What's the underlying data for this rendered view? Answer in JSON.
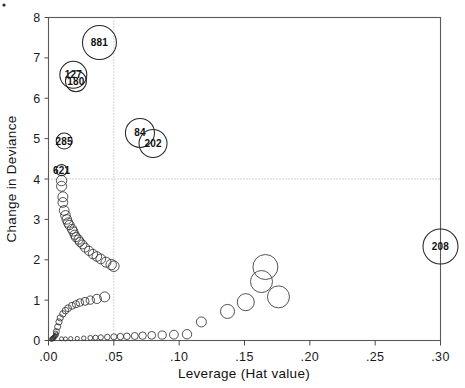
{
  "chart_data": {
    "type": "scatter",
    "title": "",
    "xlabel": "Leverage (Hat value)",
    "ylabel": "Change in Deviance",
    "xlim": [
      0.0,
      0.3
    ],
    "ylim": [
      0,
      8
    ],
    "xticks": [
      0.0,
      0.05,
      0.1,
      0.15,
      0.2,
      0.25,
      0.3
    ],
    "xticklabels": [
      ".00",
      ".05",
      ".10",
      ".15",
      ".20",
      ".25",
      ".30"
    ],
    "yticks": [
      0,
      1,
      2,
      3,
      4,
      5,
      6,
      7,
      8
    ],
    "yticklabels": [
      "0",
      "1",
      "2",
      "3",
      "4",
      "5",
      "6",
      "7",
      "8"
    ],
    "grid": false,
    "legend": "none",
    "reference_lines": [
      {
        "orientation": "horizontal",
        "value": 4.0,
        "style": "dotted"
      },
      {
        "orientation": "vertical",
        "value": 0.05,
        "style": "dotted"
      }
    ],
    "size_encoding": "Cook's distance (bubble area)",
    "labeled_points": [
      {
        "label": "881",
        "x": 0.039,
        "y": 7.38,
        "size": 17.0
      },
      {
        "label": "127",
        "x": 0.019,
        "y": 6.58,
        "size": 13.5
      },
      {
        "label": "180",
        "x": 0.021,
        "y": 6.42,
        "size": 10.5
      },
      {
        "label": "285",
        "x": 0.012,
        "y": 4.94,
        "size": 8.0
      },
      {
        "label": "621",
        "x": 0.01,
        "y": 4.22,
        "size": 5.5
      },
      {
        "label": "84",
        "x": 0.07,
        "y": 5.14,
        "size": 14.5
      },
      {
        "label": "202",
        "x": 0.08,
        "y": 4.88,
        "size": 14.0
      },
      {
        "label": "208",
        "x": 0.3,
        "y": 2.33,
        "size": 17.5
      }
    ],
    "unlabeled_points": [
      {
        "x": 0.01,
        "y": 3.96,
        "size": 5.2
      },
      {
        "x": 0.01,
        "y": 3.82,
        "size": 5.0
      },
      {
        "x": 0.011,
        "y": 3.56,
        "size": 5.0
      },
      {
        "x": 0.011,
        "y": 3.42,
        "size": 4.9
      },
      {
        "x": 0.012,
        "y": 3.22,
        "size": 4.9
      },
      {
        "x": 0.013,
        "y": 3.1,
        "size": 4.8
      },
      {
        "x": 0.014,
        "y": 3.0,
        "size": 4.8
      },
      {
        "x": 0.015,
        "y": 2.92,
        "size": 4.7
      },
      {
        "x": 0.016,
        "y": 2.86,
        "size": 4.7
      },
      {
        "x": 0.018,
        "y": 2.76,
        "size": 4.7
      },
      {
        "x": 0.019,
        "y": 2.7,
        "size": 4.6
      },
      {
        "x": 0.02,
        "y": 2.62,
        "size": 4.6
      },
      {
        "x": 0.021,
        "y": 2.56,
        "size": 4.6
      },
      {
        "x": 0.023,
        "y": 2.5,
        "size": 4.6
      },
      {
        "x": 0.024,
        "y": 2.44,
        "size": 4.5
      },
      {
        "x": 0.026,
        "y": 2.38,
        "size": 4.5
      },
      {
        "x": 0.028,
        "y": 2.3,
        "size": 4.5
      },
      {
        "x": 0.031,
        "y": 2.22,
        "size": 4.6
      },
      {
        "x": 0.034,
        "y": 2.14,
        "size": 4.7
      },
      {
        "x": 0.037,
        "y": 2.08,
        "size": 4.8
      },
      {
        "x": 0.04,
        "y": 2.02,
        "size": 4.9
      },
      {
        "x": 0.044,
        "y": 1.94,
        "size": 5.0
      },
      {
        "x": 0.048,
        "y": 1.88,
        "size": 5.2
      },
      {
        "x": 0.05,
        "y": 1.84,
        "size": 5.3
      },
      {
        "x": 0.006,
        "y": 0.22,
        "size": 3.0
      },
      {
        "x": 0.007,
        "y": 0.34,
        "size": 3.0
      },
      {
        "x": 0.008,
        "y": 0.46,
        "size": 3.1
      },
      {
        "x": 0.009,
        "y": 0.56,
        "size": 3.1
      },
      {
        "x": 0.011,
        "y": 0.66,
        "size": 3.2
      },
      {
        "x": 0.013,
        "y": 0.74,
        "size": 3.3
      },
      {
        "x": 0.015,
        "y": 0.8,
        "size": 3.4
      },
      {
        "x": 0.018,
        "y": 0.86,
        "size": 3.5
      },
      {
        "x": 0.021,
        "y": 0.9,
        "size": 3.6
      },
      {
        "x": 0.024,
        "y": 0.94,
        "size": 3.8
      },
      {
        "x": 0.028,
        "y": 0.97,
        "size": 4.0
      },
      {
        "x": 0.032,
        "y": 1.0,
        "size": 4.2
      },
      {
        "x": 0.037,
        "y": 1.03,
        "size": 4.6
      },
      {
        "x": 0.043,
        "y": 1.08,
        "size": 5.0
      },
      {
        "x": 0.117,
        "y": 0.46,
        "size": 5.0
      },
      {
        "x": 0.137,
        "y": 0.72,
        "size": 7.0
      },
      {
        "x": 0.151,
        "y": 0.95,
        "size": 8.5
      },
      {
        "x": 0.163,
        "y": 1.46,
        "size": 11.0
      },
      {
        "x": 0.166,
        "y": 1.82,
        "size": 12.5
      },
      {
        "x": 0.176,
        "y": 1.08,
        "size": 11.0
      }
    ],
    "spine_curve_note": "dense band of small overlapping circles along the lower boundary curve",
    "dense_band_lower": [
      {
        "x": 0.003,
        "y": 0.055,
        "size": 2.1
      },
      {
        "x": 0.004,
        "y": 0.075,
        "size": 2.1
      },
      {
        "x": 0.005,
        "y": 0.105,
        "size": 2.2
      },
      {
        "x": 0.006,
        "y": 0.14,
        "size": 2.2
      },
      {
        "x": 0.0055,
        "y": 0.18,
        "size": 2.2
      },
      {
        "x": 0.005,
        "y": 0.115,
        "size": 2.1
      },
      {
        "x": 0.0042,
        "y": 0.07,
        "size": 2.1
      },
      {
        "x": 0.0035,
        "y": 0.045,
        "size": 2.0
      },
      {
        "x": 0.0028,
        "y": 0.035,
        "size": 2.0
      },
      {
        "x": 0.0022,
        "y": 0.028,
        "size": 2.0
      },
      {
        "x": 0.01,
        "y": 0.042,
        "size": 2.0
      },
      {
        "x": 0.013,
        "y": 0.04,
        "size": 2.0
      },
      {
        "x": 0.017,
        "y": 0.045,
        "size": 2.1
      },
      {
        "x": 0.022,
        "y": 0.05,
        "size": 2.1
      },
      {
        "x": 0.027,
        "y": 0.058,
        "size": 2.2
      },
      {
        "x": 0.032,
        "y": 0.065,
        "size": 2.4
      },
      {
        "x": 0.036,
        "y": 0.07,
        "size": 2.5
      },
      {
        "x": 0.04,
        "y": 0.078,
        "size": 2.6
      },
      {
        "x": 0.045,
        "y": 0.085,
        "size": 2.8
      },
      {
        "x": 0.05,
        "y": 0.092,
        "size": 3.0
      },
      {
        "x": 0.055,
        "y": 0.098,
        "size": 3.2
      },
      {
        "x": 0.06,
        "y": 0.105,
        "size": 3.3
      },
      {
        "x": 0.066,
        "y": 0.112,
        "size": 3.5
      },
      {
        "x": 0.072,
        "y": 0.12,
        "size": 3.7
      },
      {
        "x": 0.079,
        "y": 0.128,
        "size": 3.9
      },
      {
        "x": 0.087,
        "y": 0.135,
        "size": 4.1
      },
      {
        "x": 0.096,
        "y": 0.145,
        "size": 4.4
      },
      {
        "x": 0.106,
        "y": 0.155,
        "size": 4.7
      }
    ]
  },
  "colors": {
    "background": "#ffffff",
    "frame": "#5a5a5a",
    "marker_stroke": "#262626",
    "reference_line": "#9a9a9a",
    "text": "#111111"
  }
}
